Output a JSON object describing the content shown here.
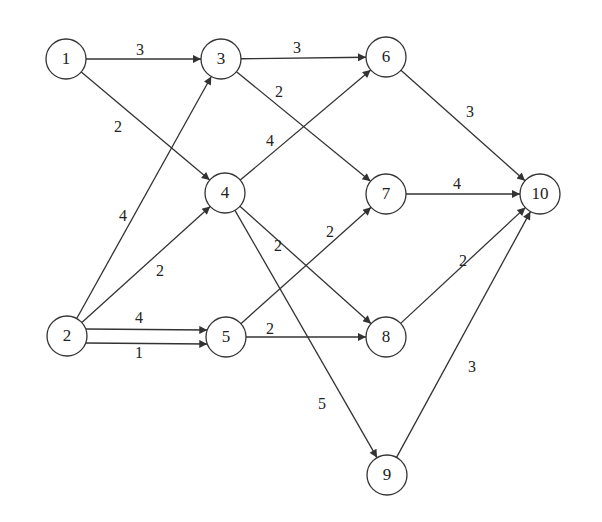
{
  "diagram": {
    "type": "directed-weighted-network",
    "node_radius": 20,
    "stroke_color": "#333333",
    "nodes": [
      {
        "id": "1",
        "label": "1",
        "x": 66,
        "y": 59
      },
      {
        "id": "2",
        "label": "2",
        "x": 67,
        "y": 336
      },
      {
        "id": "3",
        "label": "3",
        "x": 221,
        "y": 59
      },
      {
        "id": "4",
        "label": "4",
        "x": 225,
        "y": 193
      },
      {
        "id": "5",
        "label": "5",
        "x": 226,
        "y": 337
      },
      {
        "id": "6",
        "label": "6",
        "x": 386,
        "y": 57
      },
      {
        "id": "7",
        "label": "7",
        "x": 386,
        "y": 194
      },
      {
        "id": "8",
        "label": "8",
        "x": 386,
        "y": 337
      },
      {
        "id": "9",
        "label": "9",
        "x": 387,
        "y": 475
      },
      {
        "id": "10",
        "label": "10",
        "x": 540,
        "y": 194
      }
    ],
    "edges": [
      {
        "from": "1",
        "to": "3",
        "weight": "3",
        "lx": 140,
        "ly": 51
      },
      {
        "from": "1",
        "to": "4",
        "weight": "2",
        "lx": 118,
        "ly": 128
      },
      {
        "from": "2",
        "to": "3",
        "weight": "4",
        "lx": 123,
        "ly": 217
      },
      {
        "from": "2",
        "to": "4",
        "weight": "2",
        "lx": 160,
        "ly": 272
      },
      {
        "from": "2",
        "to": "5",
        "weight": "4",
        "lx": 139,
        "ly": 319,
        "y_offset": -7
      },
      {
        "from": "2",
        "to": "5",
        "weight": "1",
        "lx": 139,
        "ly": 354,
        "y_offset": 7
      },
      {
        "from": "3",
        "to": "6",
        "weight": "3",
        "lx": 297,
        "ly": 49
      },
      {
        "from": "3",
        "to": "7",
        "weight": "2",
        "lx": 279,
        "ly": 93
      },
      {
        "from": "4",
        "to": "6",
        "weight": "4",
        "lx": 270,
        "ly": 142
      },
      {
        "from": "4",
        "to": "8",
        "weight": "2",
        "lx": 278,
        "ly": 247
      },
      {
        "from": "4",
        "to": "9",
        "weight": "5",
        "lx": 322,
        "ly": 405
      },
      {
        "from": "5",
        "to": "7",
        "weight": "2",
        "lx": 330,
        "ly": 233
      },
      {
        "from": "5",
        "to": "8",
        "weight": "2",
        "lx": 270,
        "ly": 330
      },
      {
        "from": "6",
        "to": "10",
        "weight": "3",
        "lx": 470,
        "ly": 113
      },
      {
        "from": "7",
        "to": "10",
        "weight": "4",
        "lx": 457,
        "ly": 185
      },
      {
        "from": "8",
        "to": "10",
        "weight": "2",
        "lx": 463,
        "ly": 262
      },
      {
        "from": "9",
        "to": "10",
        "weight": "3",
        "lx": 472,
        "ly": 368
      }
    ]
  }
}
